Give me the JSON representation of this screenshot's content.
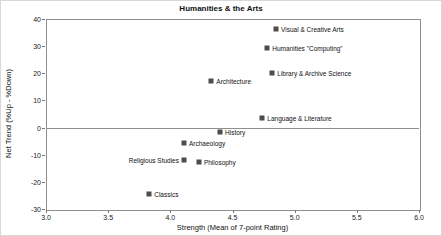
{
  "chart_data": {
    "type": "scatter",
    "title": "Humanities & the Arts",
    "xlabel": "Strength (Mean of 7-point Rating)",
    "ylabel": "Net Trend (%Up - %Down)",
    "xlim": [
      3.0,
      6.0
    ],
    "ylim": [
      -30,
      40
    ],
    "x_tick_labels": [
      "3.0",
      "3.5",
      "4.0",
      "4.5",
      "5.0",
      "5.5",
      "6.0"
    ],
    "x_tick_values": [
      3.0,
      3.5,
      4.0,
      4.5,
      5.0,
      5.5,
      6.0
    ],
    "y_tick_labels": [
      "40",
      "30",
      "20",
      "10",
      "0",
      "-10",
      "-20",
      "-30"
    ],
    "y_tick_values": [
      40,
      30,
      20,
      10,
      0,
      -10,
      -20,
      -30
    ],
    "zero_gridline": true,
    "legend": "none",
    "marker_shape": "square",
    "marker_color": "#4d4d4d",
    "frame_color": "#8f8f8f",
    "background_color": "#ffffff",
    "points": [
      {
        "label": "Visual & Creative Arts",
        "x": 4.85,
        "y": 36.5,
        "label_side": "right"
      },
      {
        "label": "Humanities \"Computing\"",
        "x": 4.78,
        "y": 29.5,
        "label_side": "right"
      },
      {
        "label": "Library & Archive Science",
        "x": 4.82,
        "y": 20,
        "label_side": "right"
      },
      {
        "label": "Architecture",
        "x": 4.33,
        "y": 17,
        "label_side": "right"
      },
      {
        "label": "Language & Literature",
        "x": 4.74,
        "y": 3.5,
        "label_side": "right"
      },
      {
        "label": "History",
        "x": 4.4,
        "y": -1.5,
        "label_side": "right"
      },
      {
        "label": "Archaeology",
        "x": 4.11,
        "y": -5.5,
        "label_side": "right"
      },
      {
        "label": "Religious Studies",
        "x": 4.11,
        "y": -12,
        "label_side": "left"
      },
      {
        "label": "Philosophy",
        "x": 4.23,
        "y": -12.5,
        "label_side": "right"
      },
      {
        "label": "Classics",
        "x": 3.83,
        "y": -24.5,
        "label_side": "right"
      }
    ]
  }
}
